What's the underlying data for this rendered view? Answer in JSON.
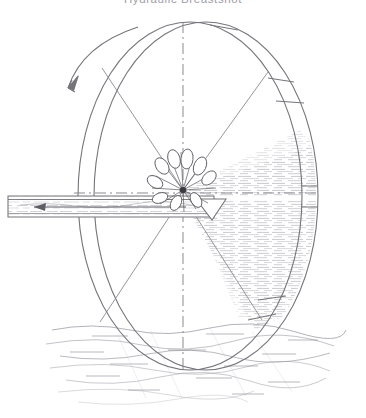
{
  "figure": {
    "title": "Hydraulic Breastshot",
    "kind": "hand-drawn technical sketch",
    "background_color": "#ffffff",
    "ink_color": "#74747a",
    "ink_color_light": "#9a9aa0",
    "water_color": "#8e8e96",
    "splash_color": "#55555c"
  },
  "wheel": {
    "label": "water wheel",
    "center_x": 198,
    "center_y": 196,
    "radius_x": 120,
    "radius_y": 176,
    "outer_rim_label": "outer rim band",
    "inner_rim_label": "inner rim",
    "rim_band_width": 26,
    "rotation": {
      "direction": "counter-clockwise",
      "arrow_label": "rotation-direction-arrow"
    },
    "spokes": {
      "label": "spokes",
      "count": 8,
      "style": "dashed",
      "angles_deg": [
        0,
        45,
        90,
        135,
        180,
        225,
        270,
        315
      ]
    },
    "buckets": {
      "label": "rim buckets",
      "count": 5,
      "divider_label": "bucket divider slat"
    }
  },
  "flume": {
    "label": "head race flume",
    "x": 8,
    "y": 196,
    "width": 210,
    "height": 21,
    "flow_arrow_label": "water-flow-arrow",
    "flow_direction": "leftward",
    "nozzle_label": "discharge nozzle"
  },
  "splash": {
    "label": "impact splash",
    "center_x": 183,
    "center_y": 190,
    "droplet_count": 9
  },
  "tailwater": {
    "label": "tail water pool",
    "surface_y": 322,
    "left_x": 44,
    "right_x": 346
  },
  "axes": {
    "horizontal_label": "horizontal centre line",
    "vertical_label": "vertical centre line",
    "style": "dash-dot"
  }
}
